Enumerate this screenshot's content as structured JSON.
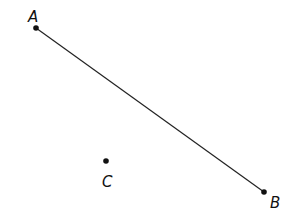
{
  "diagram": {
    "points": [
      {
        "name": "A",
        "x": 36,
        "y": 28,
        "label_x": 28,
        "label_y": 22
      },
      {
        "name": "B",
        "x": 264,
        "y": 192,
        "label_x": 270,
        "label_y": 208
      },
      {
        "name": "C",
        "x": 106,
        "y": 161,
        "label_x": 102,
        "label_y": 187
      }
    ],
    "segments": [
      {
        "from": "A",
        "to": "B"
      }
    ],
    "colors": {
      "stroke": "#222222",
      "point": "#111111"
    }
  }
}
